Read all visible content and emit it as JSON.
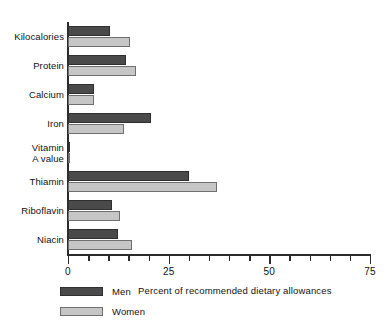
{
  "chart_data": {
    "type": "bar",
    "orientation": "horizontal",
    "title": "",
    "xlabel": "Percent of recommended dietary allowances",
    "ylabel": "",
    "xlim": [
      0,
      75
    ],
    "xticks": [
      0,
      25,
      50,
      75
    ],
    "xtick_labels": [
      "0",
      "25",
      "50",
      "75"
    ],
    "minor_tick_step": 5,
    "grid": false,
    "legend_position": "bottom-left",
    "categories": [
      "Kilocalories",
      "Protein",
      "Calcium",
      "Iron",
      "Vitamin\nA value",
      "Thiamin",
      "Riboflavin",
      "Niacin"
    ],
    "series": [
      {
        "name": "Men",
        "color": "#4a4a4a",
        "values": [
          10.5,
          14.5,
          6.5,
          20.5,
          0.5,
          30,
          11,
          12.5
        ]
      },
      {
        "name": "Women",
        "color": "#c6c6c6",
        "values": [
          15.5,
          17,
          6.5,
          14,
          0.5,
          37,
          13,
          16
        ]
      }
    ]
  },
  "legend": {
    "items": [
      {
        "label": "Men",
        "color": "#4a4a4a"
      },
      {
        "label": "Women",
        "color": "#c6c6c6"
      }
    ]
  },
  "axis": {
    "line_color": "#2b2b2b"
  }
}
